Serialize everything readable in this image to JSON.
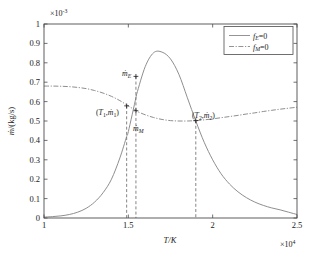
{
  "chart_data": {
    "type": "line",
    "title": "",
    "xlabel": "T/K",
    "ylabel": "ṁ/(kg/s)",
    "x_multiplier": "×10⁴",
    "y_multiplier": "×10⁻³",
    "xlim": [
      1.0,
      2.5
    ],
    "ylim": [
      0,
      1.0
    ],
    "xticks": [
      "1",
      "1.5",
      "2",
      "2.5"
    ],
    "xtick_values": [
      1.0,
      1.5,
      2.0,
      2.5
    ],
    "yticks": [
      "0",
      "0.1",
      "0.2",
      "0.3",
      "0.4",
      "0.5",
      "0.6",
      "0.7",
      "0.8",
      "0.9",
      "1"
    ],
    "ytick_values": [
      0,
      0.1,
      0.2,
      0.3,
      0.4,
      0.5,
      0.6,
      0.7,
      0.8,
      0.9,
      1.0
    ],
    "grid": false,
    "legend_position": "top-right",
    "series": [
      {
        "name": "fE=0",
        "style": "solid",
        "color": "#888888",
        "x": [
          1.0,
          1.05,
          1.1,
          1.15,
          1.2,
          1.25,
          1.3,
          1.35,
          1.4,
          1.45,
          1.49,
          1.5,
          1.545,
          1.55,
          1.6,
          1.65,
          1.7,
          1.75,
          1.8,
          1.85,
          1.9,
          1.95,
          2.0,
          2.05,
          2.1,
          2.15,
          2.2,
          2.25,
          2.3,
          2.35,
          2.4,
          2.45,
          2.5
        ],
        "values": [
          0.005,
          0.007,
          0.011,
          0.018,
          0.03,
          0.05,
          0.082,
          0.13,
          0.2,
          0.31,
          0.42,
          0.445,
          0.62,
          0.64,
          0.78,
          0.852,
          0.855,
          0.82,
          0.74,
          0.62,
          0.5,
          0.39,
          0.3,
          0.228,
          0.175,
          0.135,
          0.105,
          0.082,
          0.065,
          0.052,
          0.042,
          0.03,
          0.018
        ]
      },
      {
        "name": "fM=0",
        "style": "dashdot",
        "color": "#888888",
        "x": [
          1.0,
          1.05,
          1.1,
          1.15,
          1.2,
          1.25,
          1.3,
          1.35,
          1.4,
          1.45,
          1.49,
          1.5,
          1.545,
          1.55,
          1.6,
          1.65,
          1.7,
          1.75,
          1.8,
          1.85,
          1.9,
          1.95,
          2.0,
          2.05,
          2.1,
          2.15,
          2.2,
          2.25,
          2.3,
          2.35,
          2.4,
          2.45,
          2.5
        ],
        "values": [
          0.68,
          0.68,
          0.679,
          0.677,
          0.673,
          0.667,
          0.657,
          0.644,
          0.627,
          0.605,
          0.583,
          0.578,
          0.553,
          0.55,
          0.532,
          0.518,
          0.508,
          0.502,
          0.5,
          0.5,
          0.502,
          0.506,
          0.511,
          0.517,
          0.523,
          0.529,
          0.536,
          0.542,
          0.549,
          0.555,
          0.561,
          0.566,
          0.571
        ]
      }
    ],
    "markers": [
      {
        "name": "point-T1",
        "x": 1.49,
        "y": 0.578
      },
      {
        "name": "point-mE",
        "x": 1.545,
        "y": 0.73
      },
      {
        "name": "point-mM",
        "x": 1.545,
        "y": 0.553
      },
      {
        "name": "point-T2",
        "x": 1.9,
        "y": 0.502
      }
    ],
    "vertical_lines": [
      {
        "name": "dropline-T1",
        "x": 1.49,
        "y_top": 0.578
      },
      {
        "name": "dropline-mE",
        "x": 1.545,
        "y_top": 0.73
      },
      {
        "name": "dropline-T2",
        "x": 1.9,
        "y_top": 0.502
      }
    ],
    "annotations": [
      {
        "name": "annotation-T1-m1",
        "text": "(T₁,ṁ₁)",
        "x": 1.49,
        "y": 0.578
      },
      {
        "name": "annotation-mE",
        "text": "ṁ_E",
        "x": 1.545,
        "y": 0.73
      },
      {
        "name": "annotation-mM",
        "text": "ṁ_M",
        "x": 1.545,
        "y": 0.553
      },
      {
        "name": "annotation-T2-m2",
        "text": "(T₂,ṁ₂)",
        "x": 1.9,
        "y": 0.502
      }
    ]
  },
  "axes": {
    "y_multiplier_base": "×10",
    "y_multiplier_exp": "-3",
    "x_multiplier_base": "×10",
    "x_multiplier_exp": "4",
    "xlabel_text": "T/K",
    "ylabel_main": "ṁ",
    "ylabel_unit": "/(kg/s)",
    "xticks": {
      "t0": "1",
      "t1": "1.5",
      "t2": "2",
      "t3": "2.5"
    },
    "yticks": {
      "t0": "0",
      "t1": "0.1",
      "t2": "0.2",
      "t3": "0.3",
      "t4": "0.4",
      "t5": "0.5",
      "t6": "0.6",
      "t7": "0.7",
      "t8": "0.8",
      "t9": "0.9",
      "t10": "1"
    }
  },
  "legend": {
    "entry1": {
      "symbol": "f",
      "subscript": "E",
      "equals": "=0"
    },
    "entry2": {
      "symbol": "f",
      "subscript": "M",
      "equals": "=0"
    }
  },
  "annotations": {
    "a1_open": "(",
    "a1_T": "T",
    "a1_Tsub": "1",
    "a1_comma": ",",
    "a1_m": "ṁ",
    "a1_msub": "1",
    "a1_close": ")",
    "a2_m": "ṁ",
    "a2_sub": "E",
    "a3_m": "ṁ",
    "a3_sub": "M",
    "a4_open": "(",
    "a4_T": "T",
    "a4_Tsub": "2",
    "a4_comma": ",",
    "a4_m": "ṁ",
    "a4_msub": "2",
    "a4_close": ")"
  }
}
